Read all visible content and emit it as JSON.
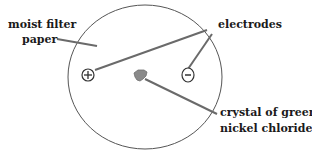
{
  "diagram": {
    "labels": {
      "filter_paper_line1": "moist filter",
      "filter_paper_line2": "paper",
      "electrodes": "electrodes",
      "crystal_line1": "crystal of green",
      "crystal_line2": "nickel chloride"
    },
    "electrodes": {
      "positive_symbol": "+",
      "negative_symbol": "−"
    },
    "colors": {
      "outline": "#555555",
      "leader_line": "#6a6a6a",
      "crystal": "#8a8a8a"
    }
  }
}
